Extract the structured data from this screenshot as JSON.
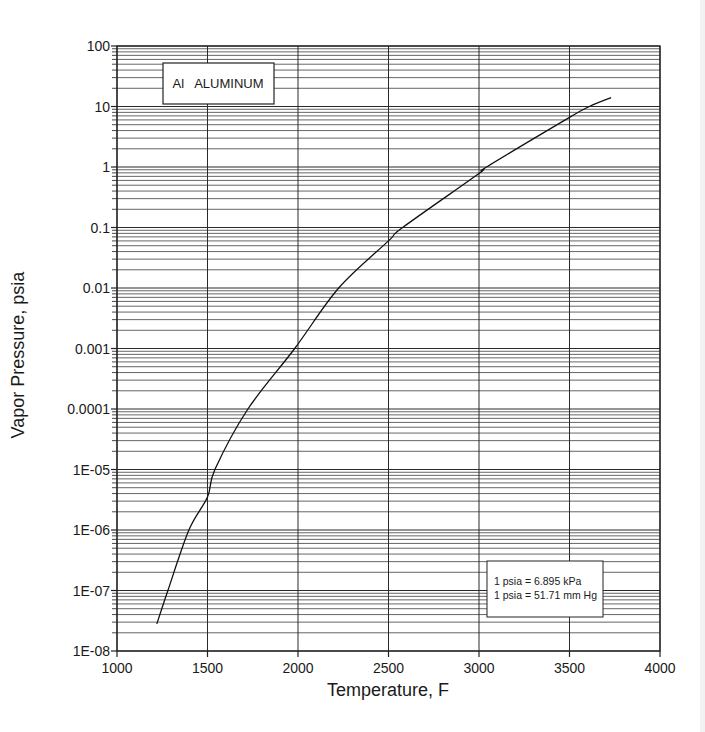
{
  "chart_data": {
    "type": "line",
    "title": "Al   ALUMINUM",
    "xlabel": "Temperature, F",
    "ylabel": "Vapor Pressure, psia",
    "xscale": "linear",
    "yscale": "log",
    "xlim": [
      1000,
      4000
    ],
    "ylim": [
      1e-08,
      100
    ],
    "x_ticks": [
      1000,
      1500,
      2000,
      2500,
      3000,
      3500,
      4000
    ],
    "x_tick_labels": [
      "1000",
      "1500",
      "2000",
      "2500",
      "3000",
      "3500",
      "4000"
    ],
    "y_ticks": [
      1e-08,
      1e-07,
      1e-06,
      1e-05,
      0.0001,
      0.001,
      0.01,
      0.1,
      1,
      10,
      100
    ],
    "y_tick_labels": [
      "1E-08",
      "1E-07",
      "1E-06",
      "1E-05",
      "0.0001",
      "0.001",
      "0.01",
      "0.1",
      "1",
      "10",
      "100"
    ],
    "grid": true,
    "minor_grid": true,
    "legend": null,
    "annotations": [
      {
        "text": "1 psia = 6.895 kPa",
        "position": "lower-right box"
      },
      {
        "text": "1 psia = 51.71 mm Hg",
        "position": "lower-right box"
      }
    ],
    "series": [
      {
        "name": "Al Aluminum vapor pressure",
        "x": [
          1220,
          1281,
          1397,
          1500,
          1541,
          1723,
          1982,
          2225,
          2500,
          2578,
          3000,
          3042,
          3500,
          3610,
          3730
        ],
        "y": [
          2.8e-08,
          1e-07,
          1e-06,
          3.5e-06,
          1e-05,
          0.0001,
          0.001,
          0.01,
          0.06,
          0.1,
          0.78,
          1,
          6.6,
          10,
          14
        ]
      }
    ]
  },
  "title_box": {
    "text": "Al   ALUMINUM"
  },
  "note_box": {
    "line1": "1 psia = 6.895 kPa",
    "line2": "1 psia = 51.71 mm Hg"
  },
  "axes": {
    "x_title": "Temperature, F",
    "y_title": "Vapor Pressure, psia"
  },
  "colors": {
    "line": "#111111",
    "grid": "#2a2a2a",
    "background": "#ffffff"
  }
}
